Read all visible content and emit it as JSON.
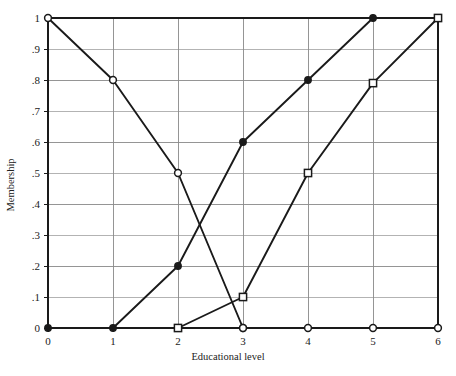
{
  "chart_data": {
    "type": "line",
    "title": "",
    "xlabel": "Educational level",
    "ylabel": "Membership",
    "xlim": [
      0,
      6
    ],
    "ylim": [
      0,
      1
    ],
    "xticks": [
      "0",
      "1",
      "2",
      "3",
      "4",
      "5",
      "6"
    ],
    "xtick_values": [
      0,
      1,
      2,
      3,
      4,
      5,
      6
    ],
    "yticks": [
      "0",
      ".1",
      ".2",
      ".3",
      ".4",
      ".5",
      ".6",
      ".7",
      ".8",
      ".9",
      "1"
    ],
    "ytick_values": [
      0,
      0.1,
      0.2,
      0.3,
      0.4,
      0.5,
      0.6,
      0.7,
      0.8,
      0.9,
      1
    ],
    "grid": true,
    "legend": "none",
    "line_color": "#1a1a1a",
    "grid_color": "#8a8a8a",
    "axis_color": "#1a1a1a",
    "marker_fill": "#ffffff",
    "series": [
      {
        "name": "low",
        "marker": "open-circle",
        "x": [
          0,
          1,
          2,
          3
        ],
        "values": [
          1,
          0.8,
          0.5,
          0
        ]
      },
      {
        "name": "high",
        "marker": "filled-circle",
        "x": [
          0,
          1,
          2,
          3,
          4,
          5,
          6
        ],
        "values": [
          0,
          0,
          0.2,
          0.6,
          0.8,
          1,
          1
        ]
      },
      {
        "name": "medium",
        "marker": "open-square",
        "x": [
          2,
          3,
          4,
          5,
          6
        ],
        "values": [
          0,
          0.1,
          0.5,
          0.79,
          1
        ]
      },
      {
        "name": "baseline",
        "marker": "open-circle",
        "x": [
          3,
          4,
          5,
          6
        ],
        "values": [
          0,
          0,
          0,
          0
        ]
      }
    ]
  }
}
